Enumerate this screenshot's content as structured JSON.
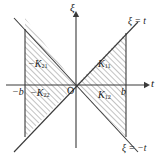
{
  "figure": {
    "type": "geometric-diagram",
    "width": 164,
    "height": 162,
    "background_color": "#ffffff",
    "line_color": "#3a3a3a",
    "hatch_color": "#8a8a8a",
    "text_color": "#1a1a1a"
  },
  "axes": {
    "horizontal": {
      "name": "t-axis",
      "label": "t",
      "label_x": 152,
      "label_y": 80,
      "y": 85,
      "x_start": 6,
      "x_end": 146,
      "arrow": "right"
    },
    "vertical": {
      "name": "xi-axis",
      "label": "ξ",
      "label_x": 72,
      "label_y": 3,
      "x": 76,
      "y_start": 148,
      "y_end": 14,
      "arrow": "up"
    },
    "origin": {
      "label": "O",
      "x": 68,
      "y": 88,
      "point_x": 76,
      "point_y": 85
    }
  },
  "ticks": [
    {
      "name": "tick-minus-b",
      "label": "−b",
      "value": "-b",
      "x": 14,
      "y": 87,
      "axis_x": 25
    },
    {
      "name": "tick-b",
      "label": "b",
      "value": "b",
      "x": 122,
      "y": 87,
      "axis_x": 126
    }
  ],
  "boundary_lines": [
    {
      "name": "line-xi-equals-t",
      "label": "ξ = t",
      "label_x": 128,
      "label_y": 20,
      "x1": 14,
      "y1": 152,
      "x2": 138,
      "y2": 22
    },
    {
      "name": "line-xi-equals-minus-t",
      "label": "ξ = −t",
      "label_x": 124,
      "label_y": 146,
      "x1": 14,
      "y1": 18,
      "x2": 138,
      "y2": 152
    },
    {
      "name": "line-t-equals-minus-b",
      "label": "",
      "x1": 25,
      "y1": 29,
      "x2": 25,
      "y2": 137
    },
    {
      "name": "line-t-equals-b",
      "label": "",
      "x1": 126,
      "y1": 33,
      "x2": 126,
      "y2": 137
    }
  ],
  "regions": [
    {
      "name": "region-K21",
      "label": "K",
      "subscript": "21",
      "sign": "−",
      "full_label": "− K21",
      "label_x": 31,
      "label_y": 63,
      "quadrant": "upper-left",
      "hatched": true
    },
    {
      "name": "region-K22",
      "label": "K",
      "subscript": "22",
      "sign": "−",
      "full_label": "− K22",
      "label_x": 33,
      "label_y": 92,
      "quadrant": "lower-left",
      "hatched": true
    },
    {
      "name": "region-K11",
      "label": "K",
      "subscript": "11",
      "sign": "",
      "full_label": "K11",
      "label_x": 98,
      "label_y": 63,
      "quadrant": "upper-right",
      "hatched": true
    },
    {
      "name": "region-K12",
      "label": "K",
      "subscript": "12",
      "sign": "",
      "full_label": "K12",
      "label_x": 98,
      "label_y": 94,
      "quadrant": "lower-right",
      "hatched": true
    }
  ]
}
